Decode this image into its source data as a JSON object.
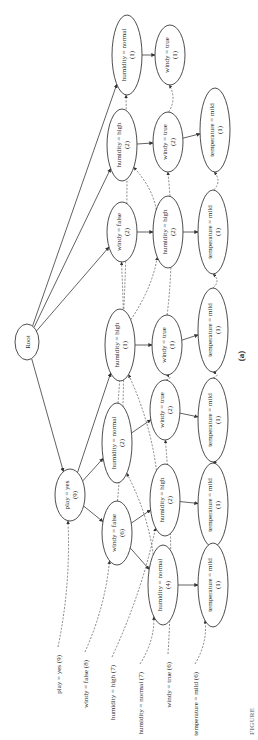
{
  "figure": {
    "caption_label": "(a)",
    "figure_tag": "FIGURE"
  },
  "header_table": [
    {
      "id": "h0",
      "label": "play = yes (9)",
      "x": 58,
      "y": 655
    },
    {
      "id": "h1",
      "label": "windy = false (8)",
      "x": 85,
      "y": 660
    },
    {
      "id": "h2",
      "label": "humidity = high (7)",
      "x": 112,
      "y": 665
    },
    {
      "id": "h3",
      "label": "humidity = normal (7)",
      "x": 140,
      "y": 672
    },
    {
      "id": "h4",
      "label": "windy = true (6)",
      "x": 168,
      "y": 662
    },
    {
      "id": "h5",
      "label": "temperature = mild (6)",
      "x": 195,
      "y": 672
    }
  ],
  "nodes": [
    {
      "id": "root",
      "line1": "Root",
      "line2": "",
      "cx": 27,
      "cy": 342,
      "rx": 12,
      "ry": 18
    },
    {
      "id": "n_py9",
      "line1": "play = yes",
      "line2": "(9)",
      "cx": 70,
      "cy": 495,
      "rx": 15,
      "ry": 26
    },
    {
      "id": "n_hn1",
      "line1": "humidity = normal",
      "line2": "(1)",
      "cx": 127,
      "cy": 55,
      "rx": 15,
      "ry": 40
    },
    {
      "id": "n_hh2a",
      "line1": "humidity = high",
      "line2": "(2)",
      "cx": 122,
      "cy": 145,
      "rx": 15,
      "ry": 36
    },
    {
      "id": "n_wf2",
      "line1": "windy = false",
      "line2": "(2)",
      "cx": 122,
      "cy": 232,
      "rx": 15,
      "ry": 30
    },
    {
      "id": "n_hh1",
      "line1": "humidity = high",
      "line2": "(1)",
      "cx": 120,
      "cy": 345,
      "rx": 15,
      "ry": 36
    },
    {
      "id": "n_hn2",
      "line1": "humidity = normal",
      "line2": "(2)",
      "cx": 117,
      "cy": 443,
      "rx": 15,
      "ry": 40
    },
    {
      "id": "n_wf6",
      "line1": "windy = false",
      "line2": "(6)",
      "cx": 117,
      "cy": 533,
      "rx": 15,
      "ry": 32
    },
    {
      "id": "n_wt1a",
      "line1": "windy = true",
      "line2": "(1)",
      "cx": 170,
      "cy": 55,
      "rx": 15,
      "ry": 30
    },
    {
      "id": "n_wt2a",
      "line1": "windy = true",
      "line2": "(2)",
      "cx": 168,
      "cy": 142,
      "rx": 15,
      "ry": 30
    },
    {
      "id": "n_hh2b",
      "line1": "humidity = high",
      "line2": "(2)",
      "cx": 168,
      "cy": 232,
      "rx": 15,
      "ry": 36
    },
    {
      "id": "n_wt1b",
      "line1": "windy = true",
      "line2": "(1)",
      "cx": 167,
      "cy": 345,
      "rx": 15,
      "ry": 30
    },
    {
      "id": "n_wt2b",
      "line1": "windy = true",
      "line2": "(2)",
      "cx": 165,
      "cy": 410,
      "rx": 15,
      "ry": 30
    },
    {
      "id": "n_hh2c",
      "line1": "humidity = high",
      "line2": "(2)",
      "cx": 165,
      "cy": 500,
      "rx": 15,
      "ry": 36
    },
    {
      "id": "n_hn4",
      "line1": "humidity = normal",
      "line2": "(4)",
      "cx": 163,
      "cy": 585,
      "rx": 15,
      "ry": 40
    },
    {
      "id": "n_tm1a",
      "line1": "temperature = mild",
      "line2": "(1)",
      "cx": 215,
      "cy": 130,
      "rx": 15,
      "ry": 42
    },
    {
      "id": "n_tm1b",
      "line1": "temperature = mild",
      "line2": "(1)",
      "cx": 213,
      "cy": 232,
      "rx": 15,
      "ry": 42
    },
    {
      "id": "n_tm1c",
      "line1": "temperature = mild",
      "line2": "(1)",
      "cx": 213,
      "cy": 330,
      "rx": 15,
      "ry": 42
    },
    {
      "id": "n_tm1d",
      "line1": "temperature = mild",
      "line2": "(1)",
      "cx": 213,
      "cy": 420,
      "rx": 15,
      "ry": 42
    },
    {
      "id": "n_tm1e",
      "line1": "temperature = mild",
      "line2": "(1)",
      "cx": 213,
      "cy": 505,
      "rx": 15,
      "ry": 42
    },
    {
      "id": "n_tm1f",
      "line1": "temperature = mild",
      "line2": "(1)",
      "cx": 213,
      "cy": 585,
      "rx": 15,
      "ry": 42
    }
  ],
  "tree_edges": [
    [
      "root",
      "n_py9"
    ],
    [
      "root",
      "n_hn1"
    ],
    [
      "root",
      "n_hh2a"
    ],
    [
      "root",
      "n_wf2"
    ],
    [
      "n_py9",
      "n_hh1"
    ],
    [
      "n_py9",
      "n_hn2"
    ],
    [
      "n_py9",
      "n_wf6"
    ],
    [
      "n_hn1",
      "n_wt1a"
    ],
    [
      "n_hh2a",
      "n_wt2a"
    ],
    [
      "n_wf2",
      "n_hh2b"
    ],
    [
      "n_hh1",
      "n_wt1b"
    ],
    [
      "n_hn2",
      "n_wt2b"
    ],
    [
      "n_wf6",
      "n_hh2c"
    ],
    [
      "n_wf6",
      "n_hn4"
    ],
    [
      "n_wt2a",
      "n_tm1a"
    ],
    [
      "n_hh2b",
      "n_tm1b"
    ],
    [
      "n_wt1b",
      "n_tm1c"
    ],
    [
      "n_wt2b",
      "n_tm1d"
    ],
    [
      "n_hh2c",
      "n_tm1e"
    ],
    [
      "n_hn4",
      "n_tm1f"
    ]
  ],
  "node_links": [
    [
      "h0",
      "n_py9"
    ],
    [
      "h1",
      "n_wf6"
    ],
    [
      "h2",
      "n_hh2c"
    ],
    [
      "h3",
      "n_hn4"
    ],
    [
      "h4",
      "n_wt2b"
    ],
    [
      "h5",
      "n_tm1f"
    ],
    [
      "n_wf6",
      "n_wf2"
    ],
    [
      "n_hh2c",
      "n_hh1"
    ],
    [
      "n_hh1",
      "n_hh2b"
    ],
    [
      "n_hh2b",
      "n_hh2a"
    ],
    [
      "n_hn4",
      "n_hn2"
    ],
    [
      "n_hn2",
      "n_hn1"
    ],
    [
      "n_wt2b",
      "n_wt1b"
    ],
    [
      "n_wt1b",
      "n_wt2a"
    ],
    [
      "n_wt2a",
      "n_wt1a"
    ],
    [
      "n_tm1f",
      "n_tm1e"
    ],
    [
      "n_tm1e",
      "n_tm1d"
    ],
    [
      "n_tm1d",
      "n_tm1c"
    ],
    [
      "n_tm1c",
      "n_tm1b"
    ],
    [
      "n_tm1b",
      "n_tm1a"
    ]
  ]
}
